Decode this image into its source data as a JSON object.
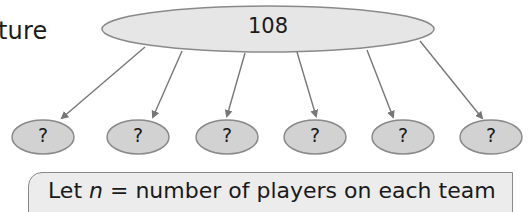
{
  "partial_heading": "ture",
  "diagram": {
    "root": {
      "value": "108",
      "fill": "#e6e6e6",
      "stroke": "#8a8a8a"
    },
    "children": [
      {
        "value": "?"
      },
      {
        "value": "?"
      },
      {
        "value": "?"
      },
      {
        "value": "?"
      },
      {
        "value": "?"
      },
      {
        "value": "?"
      }
    ],
    "child_fill": "#d2d2d2",
    "arrow_color": "#777777"
  },
  "note": {
    "prefix": "Let ",
    "variable": "n",
    "suffix": " = number of players on each team"
  }
}
